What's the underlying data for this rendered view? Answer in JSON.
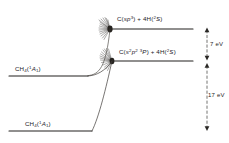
{
  "diagram": {
    "type": "energy-level-diagram",
    "background_color": "#ffffff",
    "ink_color": "#23211f",
    "levels": [
      {
        "id": "c-sp3",
        "label_plain": "C(sp3) + 4H(2S)",
        "label_prefix": "C(",
        "orbital_italic": "sp",
        "orbital_sup": "3",
        "label_mid": ") + 4H(",
        "term_sup": "2",
        "term_italic": "S",
        "label_suffix": ")",
        "y": 29,
        "x_start": 110,
        "x_end": 193,
        "has_hatch_end": true
      },
      {
        "id": "c-s2p2",
        "label_plain": "C(s2p2 3P) + 4H(2S)",
        "label_prefix": "C(",
        "orbital_italic": "s",
        "orbital_sup": "2",
        "orbital_italic2": "p",
        "orbital_sup2": "2",
        "term_sup": "3",
        "term_italic": "P",
        "label_mid": ") + 4H(",
        "term2_sup": "2",
        "term2_italic": "S",
        "label_suffix": ")",
        "y": 61,
        "x_start": 112,
        "x_end": 193,
        "has_hatch_end": true
      },
      {
        "id": "ch4-upper",
        "label_plain": "CH4(1A1)",
        "species": "CH",
        "species_sub": "4",
        "term_open": "(",
        "term_sup": "1",
        "term_italic": "A",
        "term_sub": "1",
        "term_close": ")",
        "y": 76,
        "x_start": 9,
        "x_end": 88,
        "has_hatch_end": false
      },
      {
        "id": "ch4-lower",
        "label_plain": "CH4(1A1)",
        "species": "CH",
        "species_sub": "4",
        "term_open": "(",
        "term_sup": "1",
        "term_italic": "A",
        "term_sub": "1",
        "term_close": ")",
        "y": 131,
        "x_start": 9,
        "x_end": 92,
        "has_hatch_end": false
      }
    ],
    "energy_arrows": [
      {
        "id": "gap-7ev",
        "label": "7 eV",
        "x": 207,
        "y_top": 28,
        "y_bottom": 60,
        "style": "dashed-double-headed",
        "label_x": 210,
        "label_y": 41
      },
      {
        "id": "gap-17ev",
        "label": "17 eV",
        "x": 207,
        "y_top": 63,
        "y_bottom": 131,
        "style": "dashed-double-headed",
        "label_x": 208,
        "label_y": 92
      }
    ],
    "connectors": [
      {
        "id": "connector-upper",
        "description": "curve from CH4 upper level rising to C(sp3) level",
        "from": "ch4-upper",
        "to": "c-sp3"
      },
      {
        "id": "connector-lower",
        "description": "steep line from CH4 lower level rising to C(s2p2 3P) level",
        "from": "ch4-lower",
        "to": "c-s2p2"
      }
    ]
  }
}
